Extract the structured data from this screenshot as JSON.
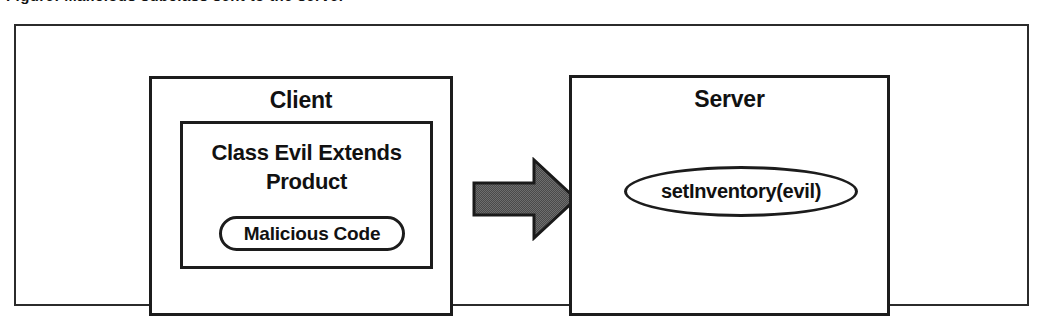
{
  "figure": {
    "caption_clipped": "Figure: Malicious subclass sent to the server",
    "outer_frame_label": "diagram-frame"
  },
  "client": {
    "title": "Client",
    "class_label": "Class Evil Extends Product",
    "malicious_label": "Malicious Code"
  },
  "server": {
    "title": "Server",
    "call_label": "setInventory(evil)"
  },
  "arrow": {
    "name": "right-arrow-icon",
    "direction": "right",
    "fill": "#666666",
    "stroke": "#1a1a1a"
  },
  "colors": {
    "background": "#ffffff",
    "line": "#1c1c1c",
    "frame": "#2b2b2b",
    "text": "#111111",
    "arrow_fill": "#666666"
  }
}
